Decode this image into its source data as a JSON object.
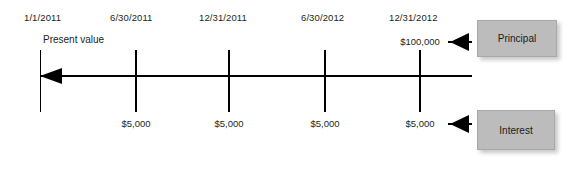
{
  "diagram": {
    "type": "timeline",
    "title": "",
    "axis": {
      "direction": "left-arrow",
      "present_value_label": "Present value"
    },
    "timeline_points": [
      {
        "date": "1/1/2011",
        "above_amount": "",
        "below_amount": ""
      },
      {
        "date": "6/30/2011",
        "above_amount": "",
        "below_amount": "$5,000"
      },
      {
        "date": "12/31/2011",
        "above_amount": "",
        "below_amount": "$5,000"
      },
      {
        "date": "6/30/2012",
        "above_amount": "",
        "below_amount": "$5,000"
      },
      {
        "date": "12/31/2012",
        "above_amount": "$100,000",
        "below_amount": "$5,000"
      }
    ],
    "callouts": [
      {
        "label": "Principal",
        "points_to": "$100,000"
      },
      {
        "label": "Interest",
        "points_to": "$5,000"
      }
    ],
    "colors": {
      "line": "#000000",
      "text": "#231f20",
      "callout_fill": "#bcbcbc",
      "background": "#ffffff"
    }
  }
}
